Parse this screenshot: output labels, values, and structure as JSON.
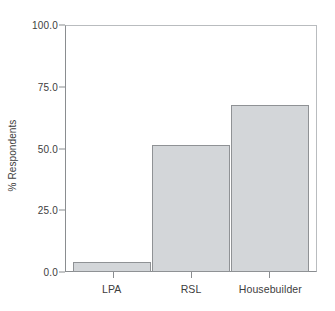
{
  "chart_data": {
    "type": "bar",
    "title": "",
    "subtitle": "",
    "xlabel": "",
    "ylabel": "% Respondents",
    "categories": [
      "LPA",
      "RSL",
      "Housebuilder"
    ],
    "values": [
      4,
      51.5,
      68
    ],
    "series": [
      {
        "name": "% Respondents",
        "values": [
          4,
          51.5,
          68
        ]
      }
    ],
    "ylim": [
      0,
      100
    ],
    "y_ticks": [
      0,
      25,
      50,
      75,
      100
    ],
    "y_ticklabels": [
      "0.0",
      "25.0",
      "50.0",
      "75.0",
      "100.0"
    ],
    "grid": false,
    "legend": false,
    "legend_position": "none",
    "annotations": [],
    "colors": {
      "bar_fill": "#d3d6d9",
      "bar_border": "#8f9295",
      "axis": "#8a8d90",
      "frame": "#b9bcbf",
      "text": "#3d3d3d",
      "background": "#ffffff"
    }
  }
}
